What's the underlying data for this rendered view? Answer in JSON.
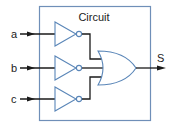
{
  "diagram": {
    "title": "Circuit",
    "inputs": [
      {
        "label": "a"
      },
      {
        "label": "b"
      },
      {
        "label": "c"
      }
    ],
    "output": {
      "label": "S"
    },
    "gates": [
      {
        "type": "NOT",
        "input": "a"
      },
      {
        "type": "NOT",
        "input": "b"
      },
      {
        "type": "NOT",
        "input": "c"
      },
      {
        "type": "OR",
        "inputs": [
          "NOT a",
          "NOT b",
          "NOT c"
        ],
        "output": "S"
      }
    ],
    "colors": {
      "box_border": "#6f8fb8",
      "wire": "#1a1a1a",
      "gate_stroke": "#5a86b8"
    }
  }
}
